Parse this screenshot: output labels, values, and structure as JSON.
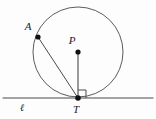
{
  "figure": {
    "kind": "geometry-diagram",
    "background_color": "#fdfdfd",
    "stroke_color": "#4a4a4a",
    "point_color": "#111111",
    "label_color": "#1b1b1b",
    "width": 156,
    "height": 119
  },
  "circle": {
    "name": "circle-P",
    "center_x": 78,
    "center_y": 52,
    "radius": 45,
    "stroke_width": 0.9
  },
  "tangent_line": {
    "name": "line-l",
    "label": "ℓ",
    "label_x": 22,
    "label_y": 110,
    "x1": 3,
    "y1": 98,
    "x2": 153,
    "y2": 98,
    "stroke_width": 1.1
  },
  "radius_segment": {
    "name": "segment-PT",
    "x1": 78,
    "y1": 52,
    "x2": 78,
    "y2": 98,
    "stroke_width": 1.1
  },
  "chord_segment": {
    "name": "segment-AT",
    "x1": 38,
    "y1": 37,
    "x2": 78,
    "y2": 98,
    "stroke_width": 1.0
  },
  "right_angle": {
    "name": "right-angle-mark-T",
    "size": 8,
    "path": "M 78 90 L 86 90 L 86 98",
    "stroke_width": 1.0
  },
  "points": [
    {
      "id": "A",
      "label": "A",
      "x": 38,
      "y": 37,
      "r": 2.6,
      "label_x": 28,
      "label_y": 30
    },
    {
      "id": "P",
      "label": "P",
      "x": 78,
      "y": 52,
      "r": 2.6,
      "label_x": 72,
      "label_y": 44
    },
    {
      "id": "T",
      "label": "T",
      "x": 78,
      "y": 98,
      "r": 2.8,
      "label_x": 73,
      "label_y": 113
    }
  ]
}
